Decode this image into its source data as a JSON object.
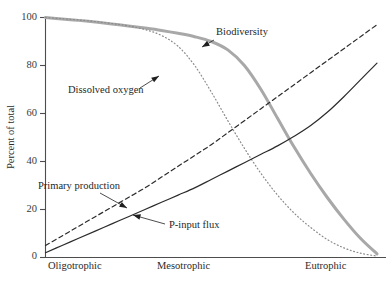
{
  "chart_data": {
    "type": "line",
    "title": "",
    "subtitle": "",
    "xlabel": "",
    "ylabel": "Percent of total",
    "xlim": [
      0,
      100
    ],
    "ylim": [
      0,
      100
    ],
    "grid": false,
    "legend_position": "inline-annotations",
    "y_ticks": [
      0,
      20,
      40,
      60,
      80,
      100
    ],
    "y_tick_labels": [
      "0",
      "20",
      "40",
      "60",
      "80",
      "100"
    ],
    "x_category_labels": [
      "Oligotrophic",
      "Mesotrophic",
      "Eutrophic"
    ],
    "x_category_positions": [
      5,
      50,
      90
    ],
    "series": [
      {
        "name": "Biodiversity",
        "style": "solid-thick",
        "color": "#a8a8a8",
        "width": 3.0,
        "x": [
          0,
          5,
          10,
          15,
          20,
          25,
          30,
          35,
          40,
          45,
          50,
          55,
          60,
          65,
          70,
          75,
          80,
          85,
          90,
          95,
          100
        ],
        "y": [
          100,
          99.4,
          98.8,
          98.1,
          97.3,
          96.5,
          95.6,
          94.6,
          93.4,
          92.0,
          90.0,
          86.5,
          80.0,
          70.0,
          58.0,
          46.0,
          35.0,
          25.0,
          16.0,
          8.0,
          1.5
        ]
      },
      {
        "name": "Dissolved oxygen",
        "style": "dotted",
        "color": "#8a8a8a",
        "width": 1.2,
        "x": [
          0,
          5,
          10,
          15,
          20,
          25,
          30,
          35,
          40,
          45,
          50,
          55,
          60,
          65,
          70,
          75,
          80,
          85,
          90,
          95,
          100
        ],
        "y": [
          100,
          99.5,
          99.0,
          98.3,
          97.5,
          96.5,
          95.0,
          92.5,
          88.0,
          80.0,
          69.0,
          57.0,
          45.5,
          35.0,
          26.0,
          18.5,
          12.5,
          7.5,
          4.0,
          1.8,
          0.6
        ]
      },
      {
        "name": "Primary production",
        "style": "dashed",
        "color": "#2b2b2b",
        "width": 1.2,
        "x": [
          0,
          5,
          10,
          15,
          20,
          25,
          30,
          35,
          40,
          45,
          50,
          55,
          60,
          65,
          70,
          75,
          80,
          85,
          90,
          95,
          100
        ],
        "y": [
          5,
          9,
          13,
          17,
          21,
          25,
          29,
          33.5,
          38,
          42.5,
          47,
          52,
          57,
          62,
          67,
          72,
          77,
          82,
          87,
          92,
          97
        ]
      },
      {
        "name": "P-input flux",
        "style": "solid-thin",
        "color": "#2b2b2b",
        "width": 1.2,
        "x": [
          0,
          5,
          10,
          15,
          20,
          25,
          30,
          35,
          40,
          45,
          50,
          55,
          60,
          65,
          70,
          75,
          80,
          85,
          90,
          95,
          100
        ],
        "y": [
          2,
          5,
          8,
          11,
          14,
          17,
          20,
          23,
          26,
          29,
          32.5,
          36,
          39.5,
          43,
          46.5,
          50.5,
          55,
          60.5,
          67,
          74,
          81
        ]
      }
    ],
    "annotations": [
      {
        "label": "Biodiversity",
        "text_x": 216,
        "text_y": 33,
        "leader_from_x": 214,
        "leader_from_y": 40,
        "leader_to_x": 202,
        "leader_to_y": 47
      },
      {
        "label": "Dissolved oxygen",
        "text_x": 68,
        "text_y": 91,
        "leader_from_x": 140,
        "leader_from_y": 88,
        "leader_to_x": 159,
        "leader_to_y": 76
      },
      {
        "label": "Primary production",
        "text_x": 38,
        "text_y": 187,
        "leader_from_x": 100,
        "leader_from_y": 193,
        "leader_to_x": 127,
        "leader_to_y": 208
      },
      {
        "label": "P-input flux",
        "text_x": 169,
        "text_y": 226,
        "leader_from_x": 165,
        "leader_from_y": 224,
        "leader_to_x": 133,
        "leader_to_y": 215
      }
    ]
  },
  "axes": {
    "y_axis_title": "Percent of total",
    "y_tick_labels": [
      "100",
      "80",
      "60",
      "40",
      "20",
      "0"
    ],
    "x_tick_labels": [
      "Oligotrophic",
      "Mesotrophic",
      "Eutrophic"
    ]
  }
}
